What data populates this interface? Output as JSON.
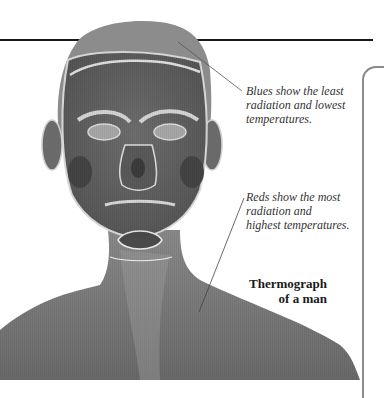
{
  "figure": {
    "palette": {
      "skin_mid": "#7a7a7a",
      "skin_dark": "#4f4f4f",
      "highlight": "#d8d8d8",
      "rule": "#1a1a1a",
      "panel_border": "#8a8a8a"
    }
  },
  "callouts": [
    {
      "lines": [
        "Blues show the least",
        "radiation and lowest",
        "temperatures."
      ]
    },
    {
      "lines": [
        "Reds show the most",
        "radiation and",
        "highest temperatures."
      ]
    }
  ],
  "caption": {
    "lines": [
      "Thermograph",
      "of a man"
    ]
  }
}
